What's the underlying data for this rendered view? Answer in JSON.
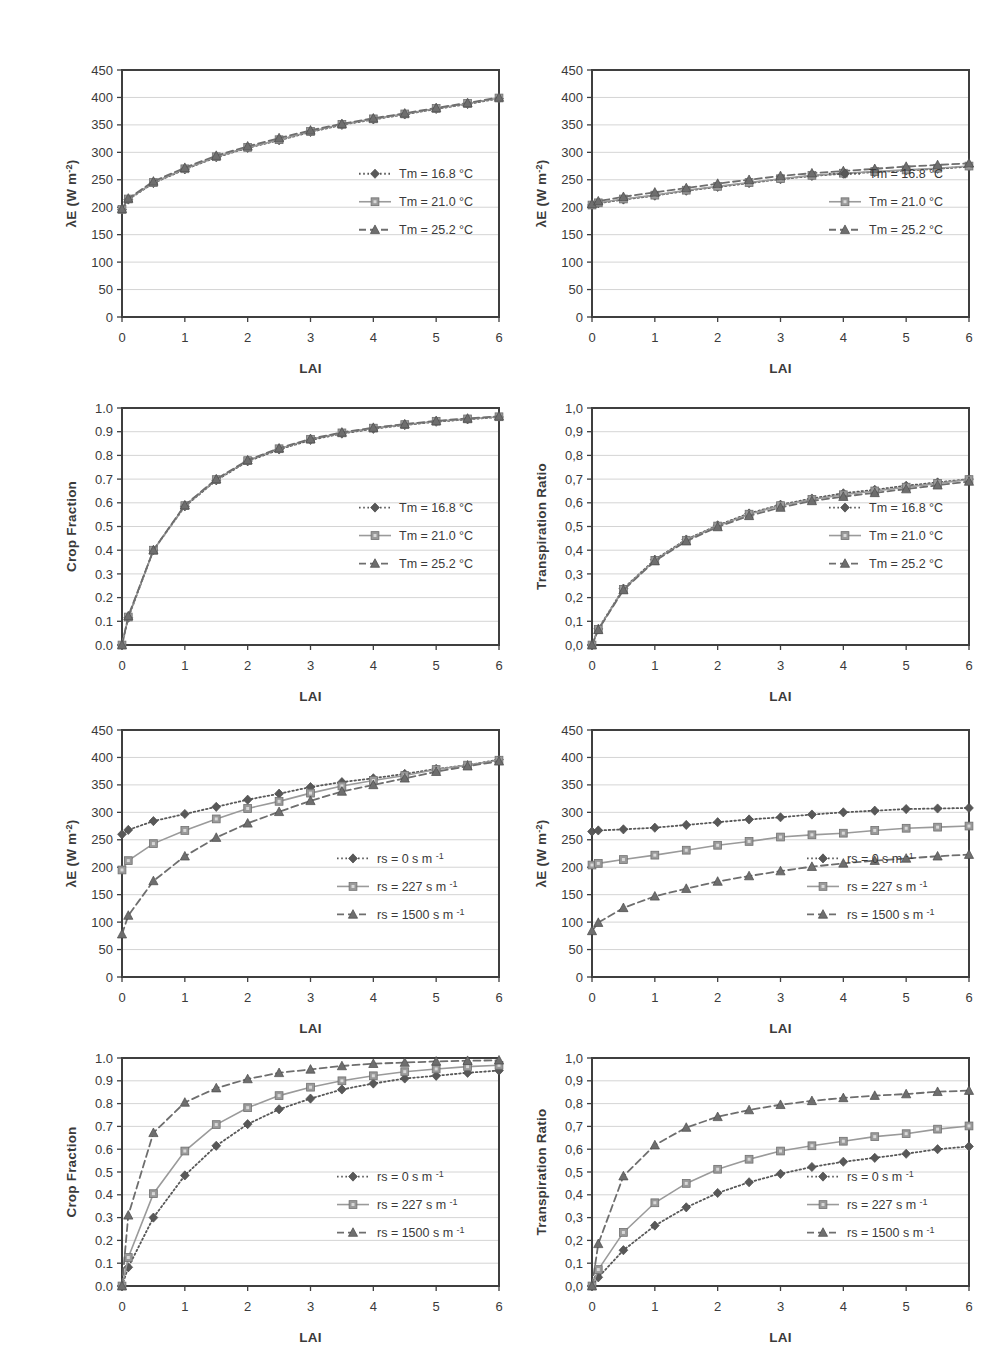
{
  "figure": {
    "background": "#ffffff",
    "axis_color": "#3f3f3f",
    "grid_color": "#c9c9c9",
    "series_colors": {
      "s1": "#585858",
      "s2": "#9a9a9a",
      "s3": "#6e6e6e"
    }
  },
  "common": {
    "xlabel": "LAI",
    "x_ticks": [
      "0",
      "1",
      "2",
      "3",
      "4",
      "5",
      "6"
    ],
    "x_values": [
      0,
      1,
      2,
      3,
      4,
      5,
      6
    ],
    "lai_points": [
      0,
      0.1,
      0.5,
      1,
      1.5,
      2,
      2.5,
      3,
      3.5,
      4,
      4.5,
      5,
      5.5,
      6
    ],
    "legend_tm": [
      "Tm = 16.8 °C",
      "Tm = 21.0 °C",
      "Tm = 25.2 °C"
    ],
    "legend_rs": [
      "rs = 0 s m",
      "rs = 227 s m",
      "rs = 1500 s m"
    ],
    "legend_rs_exp": "-1",
    "ylabel_le": "λE (W m",
    "ylabel_le_exp": "-2",
    "ylabel_le_close": ")",
    "ylabel_crop": "Crop Fraction",
    "ylabel_tr": "Transpiration Ratio"
  },
  "chart_data": [
    {
      "id": "panel-1",
      "type": "line",
      "title": "",
      "xlabel": "LAI",
      "ylabel": "λE (W m-2)",
      "xlim": [
        0,
        6
      ],
      "ylim": [
        0,
        450
      ],
      "y_ticks": [
        "0",
        "50",
        "100",
        "150",
        "200",
        "250",
        "300",
        "350",
        "400",
        "450"
      ],
      "y_tick_values": [
        0,
        50,
        100,
        150,
        200,
        250,
        300,
        350,
        400,
        450
      ],
      "x": [
        0,
        0.1,
        0.5,
        1,
        1.5,
        2,
        2.5,
        3,
        3.5,
        4,
        4.5,
        5,
        5.5,
        6
      ],
      "grid": true,
      "legend_position": "inside-right",
      "series": [
        {
          "name": "Tm = 16.8 °C",
          "style": "dotted",
          "marker": "diamond",
          "values": [
            196,
            214,
            244,
            269,
            291,
            308,
            322,
            337,
            350,
            360,
            369,
            379,
            388,
            398
          ]
        },
        {
          "name": "Tm = 21.0 °C",
          "style": "solid",
          "marker": "square",
          "values": [
            196,
            215,
            245,
            270,
            292,
            309,
            323,
            338,
            351,
            361,
            370,
            380,
            389,
            399
          ]
        },
        {
          "name": "Tm = 25.2 °C",
          "style": "dashed",
          "marker": "triangle",
          "values": [
            197,
            216,
            247,
            272,
            294,
            311,
            326,
            340,
            352,
            362,
            371,
            381,
            390,
            400
          ]
        }
      ]
    },
    {
      "id": "panel-2",
      "type": "line",
      "title": "",
      "xlabel": "LAI",
      "ylabel": "λE (W m-2)",
      "xlim": [
        0,
        6
      ],
      "ylim": [
        0,
        450
      ],
      "y_ticks": [
        "0",
        "50",
        "100",
        "150",
        "200",
        "250",
        "300",
        "350",
        "400",
        "450"
      ],
      "y_tick_values": [
        0,
        50,
        100,
        150,
        200,
        250,
        300,
        350,
        400,
        450
      ],
      "x": [
        0,
        0.1,
        0.5,
        1,
        1.5,
        2,
        2.5,
        3,
        3.5,
        4,
        4.5,
        5,
        5.5,
        6
      ],
      "grid": true,
      "legend_position": "inside-right",
      "series": [
        {
          "name": "Tm = 16.8 °C",
          "style": "dotted",
          "marker": "diamond",
          "values": [
            204,
            207,
            214,
            221,
            230,
            237,
            244,
            251,
            257,
            261,
            264,
            267,
            270,
            274
          ]
        },
        {
          "name": "Tm = 21.0 °C",
          "style": "solid",
          "marker": "square",
          "values": [
            204,
            208,
            215,
            222,
            231,
            238,
            245,
            252,
            258,
            262,
            265,
            268,
            271,
            275
          ]
        },
        {
          "name": "Tm = 25.2 °C",
          "style": "dashed",
          "marker": "triangle",
          "values": [
            206,
            211,
            219,
            227,
            235,
            243,
            250,
            257,
            262,
            266,
            270,
            274,
            277,
            280
          ]
        }
      ]
    },
    {
      "id": "panel-3",
      "type": "line",
      "title": "",
      "xlabel": "LAI",
      "ylabel": "Crop Fraction",
      "xlim": [
        0,
        6
      ],
      "ylim": [
        0,
        1.0
      ],
      "y_ticks": [
        "0.0",
        "0.1",
        "0.2",
        "0.3",
        "0.4",
        "0.5",
        "0.6",
        "0.7",
        "0.8",
        "0.9",
        "1.0"
      ],
      "y_tick_values": [
        0,
        0.1,
        0.2,
        0.3,
        0.4,
        0.5,
        0.6,
        0.7,
        0.8,
        0.9,
        1.0
      ],
      "x": [
        0,
        0.1,
        0.5,
        1,
        1.5,
        2,
        2.5,
        3,
        3.5,
        4,
        4.5,
        5,
        5.5,
        6
      ],
      "grid": true,
      "legend_position": "inside-right",
      "series": [
        {
          "name": "Tm = 16.8 °C",
          "style": "dotted",
          "marker": "diamond",
          "values": [
            0.0,
            0.115,
            0.4,
            0.585,
            0.695,
            0.775,
            0.825,
            0.865,
            0.892,
            0.912,
            0.928,
            0.942,
            0.952,
            0.962
          ]
        },
        {
          "name": "Tm = 21.0 °C",
          "style": "solid",
          "marker": "square",
          "values": [
            0.0,
            0.118,
            0.4,
            0.588,
            0.698,
            0.778,
            0.828,
            0.868,
            0.895,
            0.915,
            0.93,
            0.944,
            0.954,
            0.963
          ]
        },
        {
          "name": "Tm = 25.2 °C",
          "style": "dashed",
          "marker": "triangle",
          "values": [
            0.0,
            0.122,
            0.4,
            0.59,
            0.7,
            0.78,
            0.83,
            0.87,
            0.897,
            0.917,
            0.932,
            0.946,
            0.956,
            0.965
          ]
        }
      ]
    },
    {
      "id": "panel-4",
      "type": "line",
      "title": "",
      "xlabel": "LAI",
      "ylabel": "Transpiration Ratio",
      "xlim": [
        0,
        6
      ],
      "ylim": [
        0,
        1.0
      ],
      "y_ticks": [
        "0,0",
        "0,1",
        "0,2",
        "0,3",
        "0,4",
        "0,5",
        "0,6",
        "0,7",
        "0,8",
        "0,9",
        "1,0"
      ],
      "y_tick_values": [
        0,
        0.1,
        0.2,
        0.3,
        0.4,
        0.5,
        0.6,
        0.7,
        0.8,
        0.9,
        1.0
      ],
      "x": [
        0,
        0.1,
        0.5,
        1,
        1.5,
        2,
        2.5,
        3,
        3.5,
        4,
        4.5,
        5,
        5.5,
        6
      ],
      "grid": true,
      "legend_position": "inside-right",
      "series": [
        {
          "name": "Tm = 16.8 °C",
          "style": "dotted",
          "marker": "diamond",
          "values": [
            0.0,
            0.068,
            0.238,
            0.36,
            0.445,
            0.505,
            0.555,
            0.592,
            0.618,
            0.64,
            0.655,
            0.672,
            0.686,
            0.7
          ]
        },
        {
          "name": "Tm = 21.0 °C",
          "style": "solid",
          "marker": "square",
          "values": [
            0.0,
            0.066,
            0.235,
            0.357,
            0.442,
            0.502,
            0.552,
            0.588,
            0.614,
            0.634,
            0.65,
            0.666,
            0.682,
            0.698
          ]
        },
        {
          "name": "Tm = 25.2 °C",
          "style": "dashed",
          "marker": "triangle",
          "values": [
            0.0,
            0.064,
            0.232,
            0.354,
            0.438,
            0.498,
            0.545,
            0.58,
            0.608,
            0.626,
            0.642,
            0.658,
            0.674,
            0.69
          ]
        }
      ]
    },
    {
      "id": "panel-5",
      "type": "line",
      "title": "",
      "xlabel": "LAI",
      "ylabel": "λE (W m-2)",
      "xlim": [
        0,
        6
      ],
      "ylim": [
        0,
        450
      ],
      "y_ticks": [
        "0",
        "50",
        "100",
        "150",
        "200",
        "250",
        "300",
        "350",
        "400",
        "450"
      ],
      "y_tick_values": [
        0,
        50,
        100,
        150,
        200,
        250,
        300,
        350,
        400,
        450
      ],
      "x": [
        0,
        0.1,
        0.5,
        1,
        1.5,
        2,
        2.5,
        3,
        3.5,
        4,
        4.5,
        5,
        5.5,
        6
      ],
      "grid": true,
      "legend_position": "inside-right",
      "series": [
        {
          "name": "rs = 0 s m-1",
          "style": "dotted",
          "marker": "diamond",
          "values": [
            260,
            268,
            284,
            297,
            310,
            323,
            334,
            346,
            355,
            362,
            370,
            379,
            386,
            396
          ]
        },
        {
          "name": "rs = 227 s m-1",
          "style": "solid",
          "marker": "square",
          "values": [
            195,
            212,
            243,
            267,
            288,
            307,
            320,
            335,
            348,
            358,
            367,
            378,
            386,
            395
          ]
        },
        {
          "name": "rs = 1500 s m-1",
          "style": "dashed",
          "marker": "triangle",
          "values": [
            78,
            112,
            175,
            220,
            254,
            280,
            301,
            321,
            338,
            350,
            362,
            374,
            384,
            393
          ]
        }
      ]
    },
    {
      "id": "panel-6",
      "type": "line",
      "title": "",
      "xlabel": "LAI",
      "ylabel": "λE (W m-2)",
      "xlim": [
        0,
        6
      ],
      "ylim": [
        0,
        450
      ],
      "y_ticks": [
        "0",
        "50",
        "100",
        "150",
        "200",
        "250",
        "300",
        "350",
        "400",
        "450"
      ],
      "y_tick_values": [
        0,
        50,
        100,
        150,
        200,
        250,
        300,
        350,
        400,
        450
      ],
      "x": [
        0,
        0.1,
        0.5,
        1,
        1.5,
        2,
        2.5,
        3,
        3.5,
        4,
        4.5,
        5,
        5.5,
        6
      ],
      "grid": true,
      "legend_position": "inside-right",
      "series": [
        {
          "name": "rs = 0 s m-1",
          "style": "dotted",
          "marker": "diamond",
          "values": [
            265,
            267,
            269,
            272,
            277,
            282,
            287,
            291,
            296,
            300,
            303,
            306,
            307,
            308
          ]
        },
        {
          "name": "rs = 227 s m-1",
          "style": "solid",
          "marker": "square",
          "values": [
            204,
            207,
            214,
            222,
            231,
            240,
            247,
            255,
            259,
            262,
            267,
            271,
            273,
            275
          ]
        },
        {
          "name": "rs = 1500 s m-1",
          "style": "dashed",
          "marker": "triangle",
          "values": [
            84,
            99,
            126,
            147,
            161,
            174,
            184,
            193,
            201,
            207,
            212,
            216,
            220,
            223
          ]
        }
      ]
    },
    {
      "id": "panel-7",
      "type": "line",
      "title": "",
      "xlabel": "LAI",
      "ylabel": "Crop Fraction",
      "xlim": [
        0,
        6
      ],
      "ylim": [
        0,
        1.0
      ],
      "y_ticks": [
        "0.0",
        "0.1",
        "0.2",
        "0.3",
        "0.4",
        "0.5",
        "0.6",
        "0.7",
        "0.8",
        "0.9",
        "1.0"
      ],
      "y_tick_values": [
        0,
        0.1,
        0.2,
        0.3,
        0.4,
        0.5,
        0.6,
        0.7,
        0.8,
        0.9,
        1.0
      ],
      "x": [
        0,
        0.1,
        0.5,
        1,
        1.5,
        2,
        2.5,
        3,
        3.5,
        4,
        4.5,
        5,
        5.5,
        6
      ],
      "grid": true,
      "legend_position": "inside-right",
      "series": [
        {
          "name": "rs = 0 s m-1",
          "style": "dotted",
          "marker": "diamond",
          "values": [
            0.0,
            0.082,
            0.3,
            0.485,
            0.615,
            0.71,
            0.775,
            0.822,
            0.862,
            0.888,
            0.91,
            0.922,
            0.935,
            0.945
          ]
        },
        {
          "name": "rs = 227 s m-1",
          "style": "solid",
          "marker": "square",
          "values": [
            0.0,
            0.125,
            0.405,
            0.592,
            0.708,
            0.782,
            0.835,
            0.872,
            0.9,
            0.922,
            0.94,
            0.952,
            0.962,
            0.968
          ]
        },
        {
          "name": "rs = 1500 s m-1",
          "style": "dashed",
          "marker": "triangle",
          "values": [
            0.0,
            0.31,
            0.672,
            0.805,
            0.868,
            0.908,
            0.935,
            0.95,
            0.965,
            0.975,
            0.98,
            0.985,
            0.988,
            0.99
          ]
        }
      ]
    },
    {
      "id": "panel-8",
      "type": "line",
      "title": "",
      "xlabel": "LAI",
      "ylabel": "Transpiration Ratio",
      "xlim": [
        0,
        6
      ],
      "ylim": [
        0,
        1.0
      ],
      "y_ticks": [
        "0,0",
        "0,1",
        "0,2",
        "0,3",
        "0,4",
        "0,5",
        "0,6",
        "0,7",
        "0,8",
        "0,9",
        "1,0"
      ],
      "y_tick_values": [
        0,
        0.1,
        0.2,
        0.3,
        0.4,
        0.5,
        0.6,
        0.7,
        0.8,
        0.9,
        1.0
      ],
      "x": [
        0,
        0.1,
        0.5,
        1,
        1.5,
        2,
        2.5,
        3,
        3.5,
        4,
        4.5,
        5,
        5.5,
        6
      ],
      "grid": true,
      "legend_position": "inside-right",
      "series": [
        {
          "name": "rs = 0 s m-1",
          "style": "dotted",
          "marker": "diamond",
          "values": [
            0.0,
            0.038,
            0.157,
            0.265,
            0.345,
            0.408,
            0.455,
            0.492,
            0.522,
            0.545,
            0.562,
            0.58,
            0.6,
            0.612
          ]
        },
        {
          "name": "rs = 227 s m-1",
          "style": "solid",
          "marker": "square",
          "values": [
            0.0,
            0.072,
            0.235,
            0.365,
            0.45,
            0.512,
            0.556,
            0.592,
            0.615,
            0.635,
            0.655,
            0.668,
            0.688,
            0.702
          ]
        },
        {
          "name": "rs = 1500 s m-1",
          "style": "dashed",
          "marker": "triangle",
          "values": [
            0.0,
            0.185,
            0.482,
            0.618,
            0.695,
            0.742,
            0.772,
            0.795,
            0.812,
            0.825,
            0.835,
            0.842,
            0.852,
            0.857
          ]
        }
      ]
    }
  ],
  "panel_layout": [
    {
      "id": "panel-1",
      "left": 60,
      "top": 40,
      "width": 455,
      "height": 355,
      "ylabel_type": "le"
    },
    {
      "id": "panel-2",
      "left": 530,
      "top": 40,
      "width": 455,
      "height": 355,
      "ylabel_type": "le"
    },
    {
      "id": "panel-3",
      "left": 60,
      "top": 378,
      "width": 455,
      "height": 345,
      "ylabel_type": "crop"
    },
    {
      "id": "panel-4",
      "left": 530,
      "top": 378,
      "width": 455,
      "height": 345,
      "ylabel_type": "tr"
    },
    {
      "id": "panel-5",
      "left": 60,
      "top": 700,
      "width": 455,
      "height": 355,
      "ylabel_type": "le"
    },
    {
      "id": "panel-6",
      "left": 530,
      "top": 700,
      "width": 455,
      "height": 355,
      "ylabel_type": "le"
    },
    {
      "id": "panel-7",
      "left": 60,
      "top": 1028,
      "width": 455,
      "height": 336,
      "ylabel_type": "crop"
    },
    {
      "id": "panel-8",
      "left": 530,
      "top": 1028,
      "width": 455,
      "height": 336,
      "ylabel_type": "tr"
    }
  ]
}
